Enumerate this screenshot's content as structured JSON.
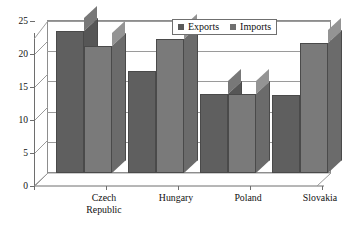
{
  "chart_data": {
    "type": "bar",
    "title": "",
    "subtitle": "",
    "xlabel": "",
    "ylabel": "",
    "ylim": [
      0,
      25
    ],
    "yticks": [
      0,
      5,
      10,
      15,
      20,
      25
    ],
    "grid": true,
    "legend_position": "top-right",
    "style": "3d-grayscale-column",
    "categories": [
      "Czech Republic",
      "Hungary",
      "Poland",
      "Slovakia"
    ],
    "category_lines": [
      [
        "Czech",
        "Republic"
      ],
      [
        "Hungary"
      ],
      [
        "Poland"
      ],
      [
        "Slovakia"
      ]
    ],
    "series": [
      {
        "name": "Exports",
        "color": "#5f5f5f",
        "values": [
          23.3,
          16.7,
          13.0,
          12.9
        ]
      },
      {
        "name": "Imports",
        "color": "#7a7a7a",
        "values": [
          20.9,
          22.0,
          13.0,
          21.4
        ]
      }
    ]
  },
  "legend": {
    "items": [
      {
        "label": "Exports",
        "marker": "square-marker-icon"
      },
      {
        "label": "Imports",
        "marker": "square-marker-icon"
      }
    ]
  },
  "axis": {
    "y_tick_labels": [
      "25",
      "20",
      "15",
      "10",
      "5",
      "0"
    ]
  }
}
